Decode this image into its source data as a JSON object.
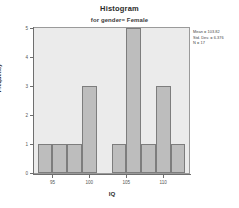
{
  "chart_data": {
    "type": "bar",
    "title": "Histogram",
    "subtitle": "for gender= Female",
    "xlabel": "IQ",
    "ylabel": "Frequency",
    "x_tick_labels": [
      "95",
      "100",
      "105",
      "110"
    ],
    "x_tick_values": [
      95,
      100,
      105,
      110
    ],
    "y_tick_labels": [
      "0",
      "1",
      "2",
      "3",
      "4",
      "5"
    ],
    "y_tick_values": [
      0,
      1,
      2,
      3,
      4,
      5
    ],
    "xlim": [
      92.5,
      113.5
    ],
    "ylim": [
      0,
      5
    ],
    "grid": false,
    "legend": "none",
    "bin_width": 2,
    "bin_starts": [
      93,
      95,
      97,
      99,
      101,
      103,
      105,
      107,
      109,
      111
    ],
    "categories": [
      "93-95",
      "95-97",
      "97-99",
      "99-101",
      "101-103",
      "103-105",
      "105-107",
      "107-109",
      "109-111",
      "111-113"
    ],
    "values": [
      1,
      1,
      1,
      3,
      0,
      1,
      5,
      1,
      3,
      1
    ],
    "bar_color": "#bdbdbd",
    "bar_border_color": "#7d7d7d",
    "plot_background": "#ebebeb"
  },
  "annotations": {
    "mean_label": "Mean = 103.82",
    "std_dev_label": "Std. Dev. = 6.376",
    "n_label": "N = 17"
  }
}
